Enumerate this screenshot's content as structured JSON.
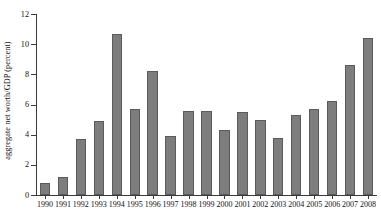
{
  "chart_data": {
    "type": "bar",
    "title": "",
    "xlabel": "",
    "ylabel": "aggregate net worth/GDP (percent)",
    "ylim": [
      0,
      12
    ],
    "yticks": [
      0,
      2,
      4,
      6,
      8,
      10,
      12
    ],
    "grid": false,
    "legend": null,
    "bar_color": "#7d7d7d",
    "bar_edge_color": "#5b5b5b",
    "axis_color": "#3a3a3a",
    "categories": [
      "1990",
      "1991",
      "1992",
      "1993",
      "1994",
      "1995",
      "1996",
      "1997",
      "1998",
      "1999",
      "2000",
      "2001",
      "2002",
      "2003",
      "2004",
      "2005",
      "2006",
      "2007",
      "2008"
    ],
    "values": [
      0.8,
      1.2,
      3.7,
      4.9,
      10.7,
      5.7,
      8.2,
      3.9,
      5.6,
      5.6,
      4.3,
      5.5,
      5.0,
      3.8,
      5.3,
      5.7,
      6.2,
      8.6,
      10.4
    ]
  }
}
